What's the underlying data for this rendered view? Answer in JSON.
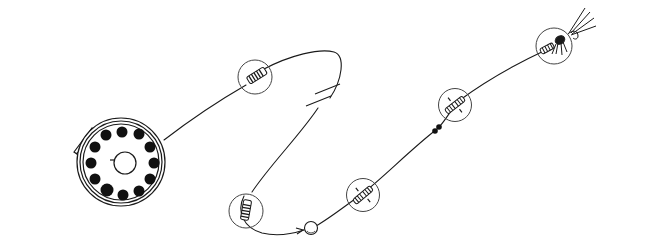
{
  "diagram": {
    "colors": {
      "background": "#ffffff",
      "ink": "#1a1a1a",
      "callout_circle": "#444444"
    },
    "components": [
      {
        "id": "reel",
        "icon": "fly-reel-icon",
        "cx": 121,
        "cy": 162,
        "r": 42
      },
      {
        "id": "knot-backing",
        "icon": "nail-knot-icon",
        "cx": 255,
        "cy": 77,
        "r": 17
      },
      {
        "id": "line-break",
        "icon": "break-mark-icon",
        "x": 325,
        "y": 100
      },
      {
        "id": "knot-loop",
        "icon": "nail-knot-icon",
        "cx": 246,
        "cy": 211,
        "r": 17
      },
      {
        "id": "bead",
        "icon": "bead-icon",
        "cx": 311,
        "cy": 228,
        "r": 6
      },
      {
        "id": "knot-blood-1",
        "icon": "blood-knot-icon",
        "cx": 363,
        "cy": 195,
        "r": 17
      },
      {
        "id": "tippet-ring",
        "icon": "tippet-ring-icon",
        "x": 437,
        "y": 129
      },
      {
        "id": "knot-blood-2",
        "icon": "blood-knot-icon",
        "cx": 454,
        "cy": 104,
        "r": 17
      },
      {
        "id": "fly",
        "icon": "fly-icon",
        "cx": 554,
        "cy": 46,
        "r": 18
      }
    ]
  }
}
